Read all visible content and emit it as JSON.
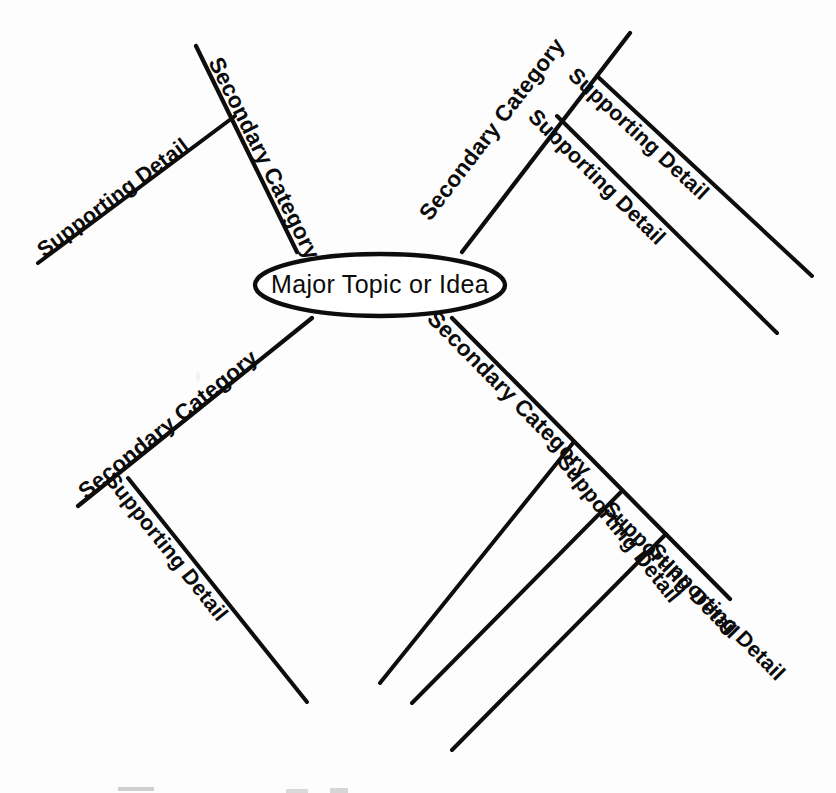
{
  "diagram": {
    "type": "mind-map",
    "center": {
      "label": "Major Topic or Idea",
      "shape": "ellipse",
      "cx": 380,
      "cy": 285,
      "rx": 125,
      "ry": 31
    },
    "colors": {
      "line": "#0d0d0d",
      "text": "#0b0b0b",
      "background": "#ffffff"
    },
    "branches": [
      {
        "id": "branch-upper-left",
        "label": "Secondary Category",
        "position": "upper-left",
        "line": {
          "x1": 297,
          "y1": 252,
          "x2": 196,
          "y2": 46
        },
        "label_anchor": {
          "x": 208,
          "y": 62
        },
        "label_rotation": 63.5,
        "children": [
          {
            "id": "detail-ul-1",
            "label": "Supporting Detail",
            "line": {
              "x1": 235,
              "y1": 116,
              "x2": 38,
              "y2": 263
            },
            "label_anchor": {
              "x": 44,
              "y": 258
            },
            "label_rotation": -36.7
          }
        ]
      },
      {
        "id": "branch-upper-right",
        "label": "Secondary Category",
        "position": "upper-right",
        "line": {
          "x1": 462,
          "y1": 252,
          "x2": 630,
          "y2": 33
        },
        "label_anchor": {
          "x": 430,
          "y": 222
        },
        "label_rotation": -52.5,
        "children": [
          {
            "id": "detail-ur-1",
            "label": "Supporting Detail",
            "line": {
              "x1": 597,
              "y1": 76,
              "x2": 812,
              "y2": 276
            },
            "label_anchor": {
              "x": 567,
              "y": 77
            },
            "label_rotation": 42.9
          },
          {
            "id": "detail-ur-2",
            "label": "Supporting Detail",
            "line": {
              "x1": 557,
              "y1": 116,
              "x2": 777,
              "y2": 333
            },
            "label_anchor": {
              "x": 527,
              "y": 118
            },
            "label_rotation": 44.6
          }
        ]
      },
      {
        "id": "branch-lower-left",
        "label": "Secondary Category",
        "position": "lower-left",
        "line": {
          "x1": 312,
          "y1": 318,
          "x2": 78,
          "y2": 506
        },
        "label_anchor": {
          "x": 86,
          "y": 500
        },
        "label_rotation": -38.8,
        "children": [
          {
            "id": "detail-ll-1",
            "label": "Supporting Detail",
            "line": {
              "x1": 128,
              "y1": 478,
              "x2": 307,
              "y2": 702
            },
            "label_anchor": {
              "x": 104,
              "y": 480
            },
            "label_rotation": 51.4
          }
        ]
      },
      {
        "id": "branch-lower-right",
        "label": "Secondary Category",
        "position": "lower-right",
        "line": {
          "x1": 452,
          "y1": 318,
          "x2": 730,
          "y2": 599
        },
        "label_anchor": {
          "x": 426,
          "y": 320
        },
        "label_rotation": 45.3,
        "children": [
          {
            "id": "detail-lr-1",
            "label": "Supporting Detail",
            "line": {
              "x1": 573,
              "y1": 443,
              "x2": 380,
              "y2": 683
            },
            "label_anchor": {
              "x": 556,
              "y": 462
            },
            "label_rotation": 51.2
          },
          {
            "id": "detail-lr-2",
            "label": "Supporting Detail",
            "line": {
              "x1": 621,
              "y1": 492,
              "x2": 412,
              "y2": 703
            },
            "label_anchor": {
              "x": 602,
              "y": 510
            },
            "label_rotation": 45.3
          },
          {
            "id": "detail-lr-3",
            "label": "Supporting Detail",
            "line": {
              "x1": 666,
              "y1": 534,
              "x2": 452,
              "y2": 750
            },
            "label_anchor": {
              "x": 648,
              "y": 552
            },
            "label_rotation": 45.3
          }
        ]
      }
    ]
  }
}
